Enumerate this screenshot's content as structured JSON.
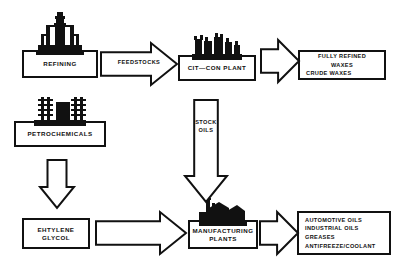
{
  "diagram": {
    "background": "#ffffff",
    "line_color": "#111111"
  },
  "nodes": [
    {
      "id": "refining",
      "label": "REFINING",
      "icon": "refinery-towers-icon",
      "x": 22,
      "y": 52,
      "w": 76,
      "h": 26
    },
    {
      "id": "petrochemicals",
      "label": "PETROCHEMICALS",
      "icon": "petrochemical-plant-icon",
      "x": 14,
      "y": 123,
      "w": 92,
      "h": 24
    },
    {
      "id": "citcon",
      "label": "CIT—CON PLANT",
      "icon": "citcon-plant-icon",
      "x": 178,
      "y": 57,
      "w": 78,
      "h": 24
    },
    {
      "id": "ethylene",
      "label": "EHTYLENE\nGLYCOL",
      "icon": "",
      "x": 22,
      "y": 218,
      "w": 68,
      "h": 31
    },
    {
      "id": "manufacturing",
      "label": "MANUFACTURING\nPLANTS",
      "icon": "manufacturing-plant-icon",
      "x": 188,
      "y": 222,
      "w": 70,
      "h": 27
    }
  ],
  "output_boxes": [
    {
      "id": "waxes",
      "x": 298,
      "y": 50,
      "w": 88,
      "h": 30,
      "lines": [
        {
          "text": "FULLY REFINED",
          "align": "center"
        },
        {
          "text": "WAXES",
          "align": "center"
        },
        {
          "text": "CRUDE WAXES",
          "align": "left"
        }
      ]
    },
    {
      "id": "products",
      "x": 297,
      "y": 211,
      "w": 94,
      "h": 44,
      "lines": [
        {
          "text": "AUTOMOTIVE OILS",
          "align": "left"
        },
        {
          "text": "INDUSTRIAL OILS",
          "align": "left"
        },
        {
          "text": "GREASES",
          "align": "left"
        },
        {
          "text": "ANTIFREEZE/COOLANT",
          "align": "left"
        }
      ]
    }
  ],
  "arrows": [
    {
      "id": "feedstocks",
      "direction": "right",
      "label": "FEEDSTOCKS",
      "x": 101,
      "y": 43,
      "w": 76,
      "h": 42,
      "label_top": 15
    },
    {
      "id": "waxes-out",
      "direction": "right",
      "label": "",
      "x": 261,
      "y": 40,
      "w": 38,
      "h": 42,
      "label_top": 0
    },
    {
      "id": "stock-oils",
      "direction": "down",
      "label": "STOCK\nOILS",
      "x": 185,
      "y": 100,
      "w": 42,
      "h": 102,
      "label_top": 18
    },
    {
      "id": "petro-to-glycol",
      "direction": "down",
      "label": "",
      "x": 40,
      "y": 160,
      "w": 34,
      "h": 48,
      "label_top": 0
    },
    {
      "id": "glycol-to-mfg",
      "direction": "right",
      "label": "",
      "x": 96,
      "y": 212,
      "w": 90,
      "h": 42,
      "label_top": 0
    },
    {
      "id": "products-out",
      "direction": "right",
      "label": "",
      "x": 260,
      "y": 212,
      "w": 38,
      "h": 42,
      "label_top": 0
    }
  ]
}
